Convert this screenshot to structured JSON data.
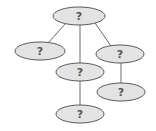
{
  "diagram": {
    "type": "tree",
    "colors": {
      "node_fill": "#e3e3e3",
      "node_stroke": "#5a5a5a",
      "edge": "#6a6a6a",
      "text": "#555555"
    },
    "nodes": [
      {
        "id": "root",
        "label": "?",
        "cx": 79,
        "cy": 16,
        "rx": 26,
        "ry": 9
      },
      {
        "id": "left",
        "label": "?",
        "cx": 40,
        "cy": 51,
        "rx": 25,
        "ry": 9
      },
      {
        "id": "middle",
        "label": "?",
        "cx": 80,
        "cy": 72,
        "rx": 24,
        "ry": 9
      },
      {
        "id": "right",
        "label": "?",
        "cx": 120,
        "cy": 54,
        "rx": 24,
        "ry": 9
      },
      {
        "id": "right-child",
        "label": "?",
        "cx": 121,
        "cy": 92,
        "rx": 24,
        "ry": 9
      },
      {
        "id": "middle-child",
        "label": "?",
        "cx": 80,
        "cy": 114,
        "rx": 24,
        "ry": 9
      }
    ],
    "edges": [
      {
        "from": "root",
        "to": "left"
      },
      {
        "from": "root",
        "to": "middle"
      },
      {
        "from": "root",
        "to": "right"
      },
      {
        "from": "middle",
        "to": "middle-child"
      },
      {
        "from": "right",
        "to": "right-child"
      }
    ]
  }
}
